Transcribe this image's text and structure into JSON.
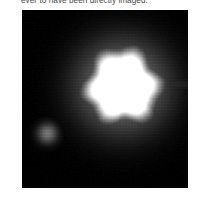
{
  "caption": {
    "text": "ever to have been directly imaged."
  },
  "figure": {
    "name": "direct-image-of-exoplanet-system",
    "background_color": "#000000",
    "frame": {
      "x": 22,
      "y": 10,
      "width": 166,
      "height": 178
    },
    "objects": [
      {
        "label": "primary-source",
        "role": "host star (saturated, overexposed core)",
        "center": {
          "x": 100,
          "y": 76
        },
        "core_radius": 30,
        "halo_radius": 52,
        "peak_brightness": "#ffffff",
        "shape": "slightly polygonal / irregular diffuse disk",
        "notes": "faint horizontal spike extending toward the right edge"
      },
      {
        "label": "companion-source",
        "role": "faint companion / planet candidate",
        "center": {
          "x": 25,
          "y": 123
        },
        "core_radius": 7,
        "halo_radius": 12,
        "peak_brightness": "#6a6a6a",
        "shape": "small round blob with visible detector striping"
      }
    ]
  }
}
